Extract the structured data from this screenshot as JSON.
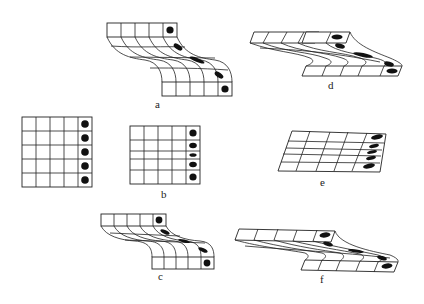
{
  "figure": {
    "panels": [
      {
        "id": "a",
        "label": "a",
        "description": "sheared strip with S-curved columns, circular dots at ends, elongated ellipses in middle"
      },
      {
        "id": "b",
        "label": "b",
        "description": "5x5 grid, right column has circles with middle rows compressed"
      },
      {
        "id": "c",
        "label": "c",
        "description": "sheared strip (narrower) with S-curved columns and dots"
      },
      {
        "id": "d",
        "label": "d",
        "description": "oblique sheared strip with elliptical dots"
      },
      {
        "id": "e",
        "label": "e",
        "description": "oblique parallelogram grid with elliptical dots in right column"
      },
      {
        "id": "f",
        "label": "f",
        "description": "oblique sheared strip, thinner, with elliptical dots"
      }
    ],
    "unlabeled_panel": {
      "id": "undeformed",
      "description": "5x5 square grid with circles in right column"
    }
  }
}
